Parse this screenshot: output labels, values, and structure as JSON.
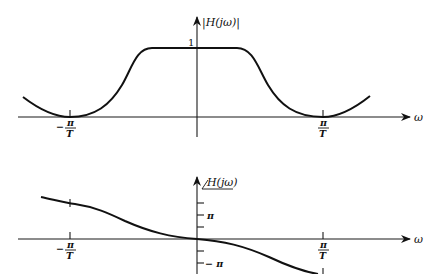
{
  "magnitude_plot": {
    "y_label": "|H(jω)|",
    "x_label": "ω",
    "y_tick_label": "1",
    "x_ticks": [
      {
        "sign": "−",
        "num": "π",
        "den": "T"
      },
      {
        "sign": "",
        "num": "π",
        "den": "T"
      }
    ],
    "description": "Lowpass magnitude response: flat at 1 near ω=0, falling to 0 at ±π/T, rising again beyond"
  },
  "phase_plot": {
    "y_label": "/H(jω)",
    "x_label": "ω",
    "y_tick_labels": {
      "pos_pi": "π",
      "neg_pi": "− π"
    },
    "x_ticks": [
      {
        "sign": "−",
        "num": "π",
        "den": "T"
      },
      {
        "sign": "",
        "num": "π",
        "den": "T"
      }
    ],
    "description": "Phase decreasing monotonically through origin, odd-symmetric"
  }
}
